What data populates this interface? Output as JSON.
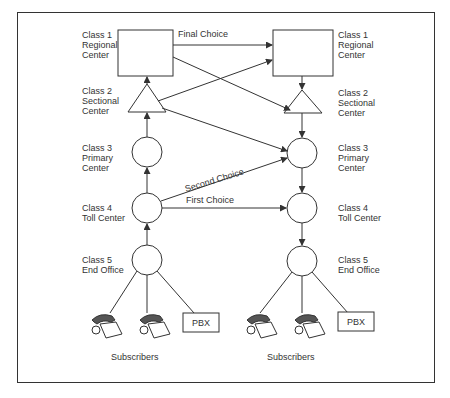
{
  "left_labels": [
    "Class 1\nRegional\nCenter",
    "Class 2\nSectional\nCenter",
    "Class 3\nPrimary\nCenter",
    "Class 4\nToll Center",
    "Class 5\nEnd Office"
  ],
  "right_labels": [
    "Class 1\nRegional\nCenter",
    "Class 2\nSectional\nCenter",
    "Class 3\nPrimary\nCenter",
    "Class 4\nToll Center",
    "Class 5\nEnd Office"
  ],
  "routes": {
    "final": "Final Choice",
    "second": "Second Choice",
    "first": "First Choice"
  },
  "pbx": "PBX",
  "subscribers": "Subscribers"
}
